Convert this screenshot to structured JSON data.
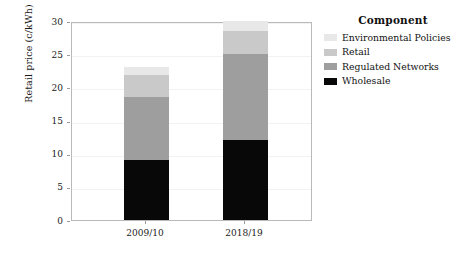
{
  "chart_data": {
    "type": "bar",
    "stacked": true,
    "title": "",
    "xlabel": "",
    "ylabel": "Retail price (c/kWh)",
    "categories": [
      "2009/10",
      "2018/19"
    ],
    "ylim": [
      0,
      30
    ],
    "yticks": [
      0,
      5,
      10,
      15,
      20,
      25,
      30
    ],
    "grid": true,
    "legend_position": "right",
    "legend_title": "Component",
    "series": [
      {
        "name": "Wholesale",
        "color": "#080808",
        "values": [
          9.0,
          12.0
        ]
      },
      {
        "name": "Regulated Networks",
        "color": "#9e9e9e",
        "values": [
          9.5,
          13.0
        ]
      },
      {
        "name": "Retail",
        "color": "#c9c9c9",
        "values": [
          3.3,
          3.5
        ]
      },
      {
        "name": "Environmental Policies",
        "color": "#e8e8e8",
        "values": [
          1.2,
          1.5
        ]
      }
    ],
    "totals": [
      23.0,
      30.0
    ]
  },
  "axes": {
    "ytick_labels": [
      "0",
      "5",
      "10",
      "15",
      "20",
      "25",
      "30"
    ],
    "xtick_labels": [
      "2009/10",
      "2018/19"
    ],
    "ylabel": "Retail price (c/kWh)"
  },
  "legend": {
    "title": "Component",
    "items": [
      {
        "label": "Environmental Policies",
        "color": "#e8e8e8"
      },
      {
        "label": "Retail",
        "color": "#c9c9c9"
      },
      {
        "label": "Regulated Networks",
        "color": "#9e9e9e"
      },
      {
        "label": "Wholesale",
        "color": "#080808"
      }
    ]
  },
  "colors": {
    "frame": "#b9b9b9",
    "grid": "#f2f2f2",
    "text": "#1a1a1a",
    "background": "#ffffff"
  }
}
